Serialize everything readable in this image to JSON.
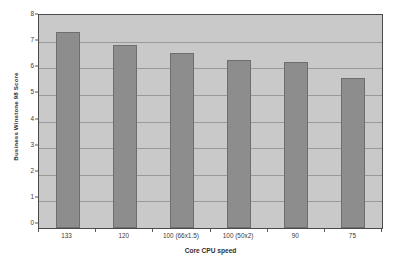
{
  "chart_data": {
    "type": "bar",
    "title": "",
    "subtitle": "",
    "xlabel": "Core CPU speed",
    "ylabel": "Business Winstone 98 Score",
    "categories": [
      "133",
      "120",
      "100 (66x1.5)",
      "100 (50x2)",
      "90",
      "75"
    ],
    "values": [
      7.37,
      6.88,
      6.58,
      6.3,
      6.22,
      5.62
    ],
    "ylim": [
      0,
      8
    ],
    "ytick_values": [
      0,
      1,
      2,
      3,
      4,
      5,
      6,
      7,
      8
    ],
    "ytick_labels": [
      "0",
      "1",
      "2",
      "3",
      "4",
      "5",
      "6",
      "7",
      "8"
    ],
    "grid": true,
    "grid_axis": "y",
    "legend": false,
    "legend_position": "none",
    "series": [
      {
        "name": "Business Winstone 98 Score",
        "values": [
          7.37,
          6.88,
          6.58,
          6.3,
          6.22,
          5.62
        ]
      }
    ],
    "annotations": []
  },
  "style": {
    "page_background": "#ffffff",
    "plot_background": "#c9c9c9",
    "bar_fill": "#8d8d8d",
    "bar_border": "#6e6e6e",
    "gridline_color": "#9a9a9a",
    "axis_color": "#4a4a4a",
    "text_color": "#3b3b3b"
  }
}
